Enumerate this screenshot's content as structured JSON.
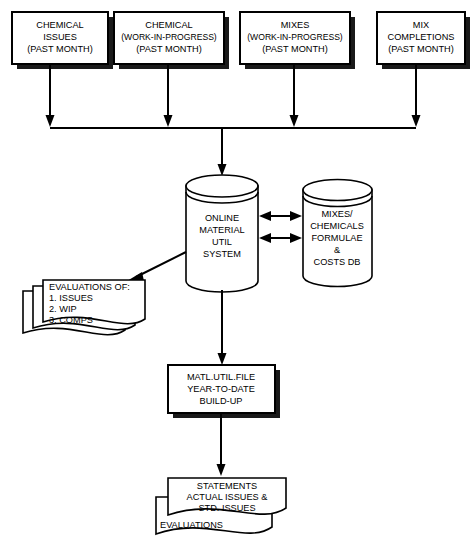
{
  "diagram": {
    "colors": {
      "ink": "#000000",
      "paper": "#ffffff",
      "shadow": "#1a1a1a"
    }
  },
  "inputs": [
    {
      "id": "chemical-issues",
      "lines": [
        "CHEMICAL",
        "ISSUES",
        "(PAST MONTH)"
      ]
    },
    {
      "id": "chemical-wip",
      "lines": [
        "CHEMICAL",
        "(WORK-IN-PROGRESS)",
        "(PAST MONTH)"
      ]
    },
    {
      "id": "mixes-wip",
      "lines": [
        "MIXES",
        "(WORK-IN-PROGRESS)",
        "(PAST MONTH)"
      ]
    },
    {
      "id": "mix-completions",
      "lines": [
        "MIX",
        "COMPLETIONS",
        "(PAST MONTH)"
      ]
    }
  ],
  "databases": [
    {
      "id": "online-material-util-system",
      "lines": [
        "ONLINE",
        "MATERIAL",
        "UTIL",
        "SYSTEM"
      ]
    },
    {
      "id": "mixes-chemicals-formulae-costs-db",
      "lines": [
        "MIXES/",
        "CHEMICALS",
        "FORMULAE",
        "&",
        "COSTS DB"
      ]
    }
  ],
  "evaluations_stack": {
    "id": "evaluations-of-documents",
    "lines": [
      "EVALUATIONS OF:",
      "1. ISSUES",
      "2. WIP",
      "3. COMPS"
    ]
  },
  "process": {
    "id": "matl-util-file",
    "lines": [
      "MATL.UTIL.FILE",
      "YEAR-TO-DATE",
      "BUILD-UP"
    ]
  },
  "statements_stack": {
    "id": "statements-documents",
    "lines": [
      "STATEMENTS",
      "ACTUAL ISSUES &",
      "STD. ISSUES"
    ],
    "back_sheet_label": "EVALUATIONS"
  }
}
